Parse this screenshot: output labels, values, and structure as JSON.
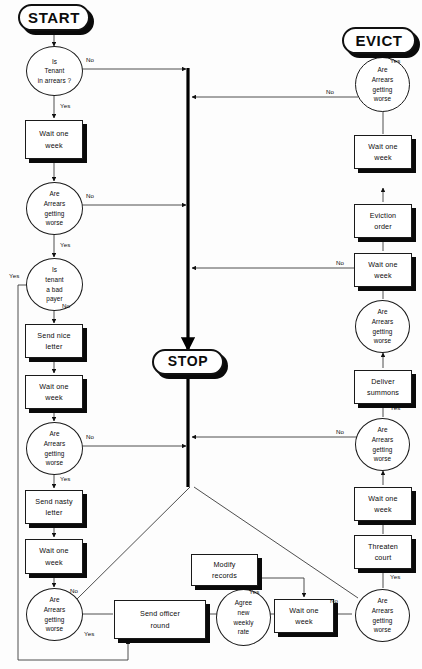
{
  "diagram": {
    "colors": {
      "ink": "#0c0c0c",
      "line": "#3a3a3a",
      "spine": "#000000",
      "shadow": "#0a0a0a",
      "background": "#ffffff"
    }
  },
  "terminators": {
    "start": "START",
    "stop": "STOP",
    "evict": "EVICT"
  },
  "nodes": {
    "tenant_in_arrears": {
      "lines": [
        "Is",
        "Tenant",
        "in arrears ?"
      ]
    },
    "wait_1": {
      "lines": [
        "Wait one",
        "week"
      ]
    },
    "worse_1": {
      "lines": [
        "Are",
        "Arrears",
        "getting",
        "worse"
      ]
    },
    "bad_payer": {
      "lines": [
        "Is",
        "tenant",
        "a bad",
        "payer"
      ]
    },
    "send_nice_letter": {
      "lines": [
        "Send nice",
        "letter"
      ]
    },
    "wait_2": {
      "lines": [
        "Wait one",
        "week"
      ]
    },
    "worse_2": {
      "lines": [
        "Are",
        "Arrears",
        "getting",
        "worse"
      ]
    },
    "send_nasty_letter": {
      "lines": [
        "Send nasty",
        "letter"
      ]
    },
    "wait_3": {
      "lines": [
        "Wait one",
        "week"
      ]
    },
    "worse_3": {
      "lines": [
        "Are",
        "Arrears",
        "getting",
        "worse"
      ]
    },
    "send_officer_round": {
      "lines": [
        "Send officer",
        "round"
      ]
    },
    "agree_new_rate": {
      "lines": [
        "Agree",
        "new",
        "weekly",
        "rate"
      ]
    },
    "modify_records": {
      "lines": [
        "Modify",
        "records"
      ]
    },
    "wait_4": {
      "lines": [
        "Wait one",
        "week"
      ]
    },
    "worse_4": {
      "lines": [
        "Are",
        "Arrears",
        "getting",
        "worse"
      ]
    },
    "threaten_court": {
      "lines": [
        "Threaten",
        "court"
      ]
    },
    "wait_5": {
      "lines": [
        "Wait one",
        "week"
      ]
    },
    "worse_5": {
      "lines": [
        "Are",
        "Arrears",
        "getting",
        "worse"
      ]
    },
    "deliver_summons": {
      "lines": [
        "Deliver",
        "summons"
      ]
    },
    "worse_6": {
      "lines": [
        "Are",
        "Arrears",
        "getting",
        "worse"
      ]
    },
    "wait_6": {
      "lines": [
        "Wait one",
        "week"
      ]
    },
    "eviction_order": {
      "lines": [
        "Eviction",
        "order"
      ]
    },
    "wait_7": {
      "lines": [
        "Wait one",
        "week"
      ]
    },
    "worse_7": {
      "lines": [
        "Are",
        "Arrears",
        "getting",
        "worse"
      ]
    }
  },
  "edge_labels": {
    "arrears_no": "No",
    "arrears_yes": "Yes",
    "worse1_no": "No",
    "worse1_yes": "Yes",
    "badpayer_yes": "Yes",
    "badpayer_no": "No",
    "worse2_no": "No",
    "worse2_yes": "Yes",
    "worse3_no": "No",
    "worse3_yes": "Yes",
    "agree_yes": "Yes",
    "worse4_no": "No",
    "worse4_yes": "Yes",
    "worse5_no": "No",
    "worse5_yes": "Yes",
    "worse6_no": "No",
    "worse6_yes": "Yes",
    "worse7_no": "No",
    "worse7_yes": "Yes"
  }
}
